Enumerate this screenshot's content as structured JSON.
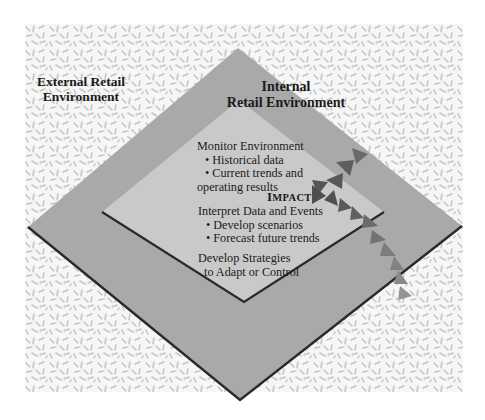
{
  "diagram": {
    "external": {
      "label_line1": "External Retail",
      "label_line2": "Environment"
    },
    "internal": {
      "label_line1": "Internal",
      "label_line2": "Retail Environment"
    },
    "monitor": {
      "heading": "Monitor Environment",
      "bullets": [
        "• Historical data",
        "• Current trends and",
        "operating results"
      ]
    },
    "impact": {
      "first": "I",
      "rest": "MPACT"
    },
    "interpret": {
      "heading": "Interpret Data and Events",
      "bullets": [
        "• Develop scenarios",
        "• Forecast future trends"
      ]
    },
    "develop": {
      "line1": "Develop Strategies",
      "line2": "to Adapt or Control"
    },
    "colors": {
      "outer_diamond": "#a9a9a9",
      "inner_diamond": "#c9c9c9",
      "edge": "#2a2a2a",
      "texture_fill": "#f4f4f4",
      "texture_marks": "#c4c4c4",
      "arrow_dark": "#555555",
      "arrow_light": "#8a8a8a"
    }
  }
}
